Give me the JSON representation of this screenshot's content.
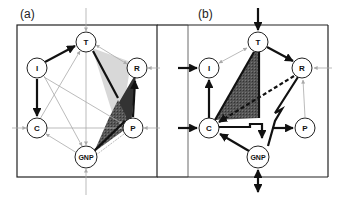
{
  "panels": [
    {
      "label": "(a)",
      "nodes": {
        "T": {
          "label": "T",
          "x": 86,
          "y": 42
        },
        "I": {
          "label": "I",
          "x": 37,
          "y": 68
        },
        "R": {
          "label": "R",
          "x": 137,
          "y": 68
        },
        "C": {
          "label": "C",
          "x": 37,
          "y": 128
        },
        "P": {
          "label": "P",
          "x": 133,
          "y": 128
        },
        "GNP": {
          "label": "GNP",
          "x": 86,
          "y": 157
        }
      }
    },
    {
      "label": "(b)",
      "nodes": {
        "T": {
          "label": "T",
          "x": 258,
          "y": 42
        },
        "I": {
          "label": "I",
          "x": 209,
          "y": 68
        },
        "R": {
          "label": "R",
          "x": 302,
          "y": 68
        },
        "C": {
          "label": "C",
          "x": 209,
          "y": 128
        },
        "P": {
          "label": "P",
          "x": 305,
          "y": 128
        },
        "GNP": {
          "label": "GNP",
          "x": 258,
          "y": 157
        }
      }
    }
  ],
  "colors": {
    "strong": "#111111",
    "weak": "#aaaaaa",
    "light_fill": "#d8d8d8",
    "dark_fill": "#444444",
    "mid_fill": "#666666",
    "frame": "#222222"
  }
}
